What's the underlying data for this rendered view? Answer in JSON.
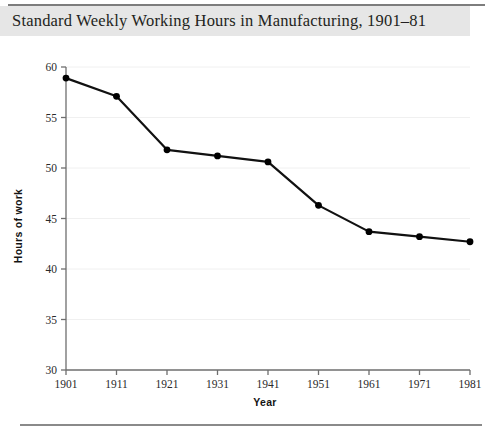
{
  "title": "Standard Weekly Working Hours in Manufacturing, 1901–81",
  "colors": {
    "title_band": "#e6e6e6",
    "rule": "#7d7d7d",
    "line": "#111111",
    "marker": "#000000",
    "gridline": "#f0f0f0",
    "axis": "#6e6e6e",
    "text": "#231f20"
  },
  "chart_data": {
    "type": "line",
    "title": "Standard Weekly Working Hours in Manufacturing, 1901–81",
    "xlabel": "Year",
    "ylabel": "Hours of work",
    "categories": [
      "1901",
      "1911",
      "1921",
      "1931",
      "1941",
      "1951",
      "1961",
      "1971",
      "1981"
    ],
    "x": [
      1901,
      1911,
      1921,
      1931,
      1941,
      1951,
      1961,
      1971,
      1981
    ],
    "values": [
      58.9,
      57.1,
      51.8,
      51.2,
      50.6,
      46.3,
      43.7,
      43.2,
      42.7
    ],
    "series": [
      {
        "name": "Hours of work",
        "values": [
          58.9,
          57.1,
          51.8,
          51.2,
          50.6,
          46.3,
          43.7,
          43.2,
          42.7
        ]
      }
    ],
    "ylim": [
      30,
      60
    ],
    "yticks": [
      30,
      35,
      40,
      45,
      50,
      55,
      60
    ],
    "ytick_labels": [
      "30",
      "35",
      "40",
      "45",
      "50",
      "55",
      "60"
    ],
    "xticks": [
      1901,
      1911,
      1921,
      1931,
      1941,
      1951,
      1961,
      1971,
      1981
    ],
    "xtick_labels": [
      "1901",
      "1911",
      "1921",
      "1931",
      "1941",
      "1951",
      "1961",
      "1971",
      "1981"
    ],
    "grid": true,
    "grid_axis": "y",
    "legend": false,
    "legend_position": "none",
    "marker": "circle",
    "annotations": []
  }
}
